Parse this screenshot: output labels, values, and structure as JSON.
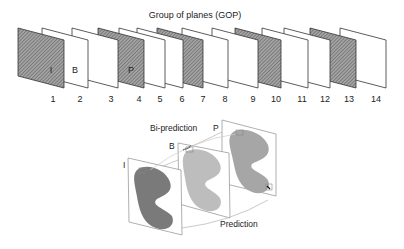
{
  "gop": {
    "title": "Group of planes (GOP)",
    "planes": [
      {
        "index": "1",
        "type": "I",
        "label": "I",
        "hatched": true,
        "x": 18
      },
      {
        "index": "2",
        "type": "B",
        "label": "B",
        "hatched": false,
        "x": 42
      },
      {
        "index": "3",
        "type": "B",
        "label": "",
        "hatched": false,
        "x": 72
      },
      {
        "index": "4",
        "type": "P",
        "label": "P",
        "hatched": true,
        "x": 98
      },
      {
        "index": "5",
        "type": "B",
        "label": "",
        "hatched": false,
        "x": 119
      },
      {
        "index": "6",
        "type": "B",
        "label": "",
        "hatched": false,
        "x": 137
      },
      {
        "index": "7",
        "type": "P",
        "label": "",
        "hatched": true,
        "x": 157
      },
      {
        "index": "8",
        "type": "B",
        "label": "",
        "hatched": false,
        "x": 182
      },
      {
        "index": "9",
        "type": "B",
        "label": "",
        "hatched": false,
        "x": 212
      },
      {
        "index": "10",
        "type": "P",
        "label": "",
        "hatched": true,
        "x": 235
      },
      {
        "index": "11",
        "type": "B",
        "label": "",
        "hatched": false,
        "x": 262
      },
      {
        "index": "12",
        "type": "B",
        "label": "",
        "hatched": false,
        "x": 284
      },
      {
        "index": "13",
        "type": "P",
        "label": "",
        "hatched": true,
        "x": 310
      },
      {
        "index": "14",
        "type": "B",
        "label": "",
        "hatched": false,
        "x": 340
      }
    ]
  },
  "prediction_diagram": {
    "bi_prediction_label": "Bi-prediction",
    "prediction_label": "Prediction",
    "frames": [
      {
        "label": "I",
        "shade": "#7a7a7a"
      },
      {
        "label": "B",
        "shade": "#bdbdbd"
      },
      {
        "label": "P",
        "shade": "#a6a6a6"
      }
    ]
  },
  "colors": {
    "stroke": "#333333",
    "hatch_bg": "#9a9a9a",
    "hatch_line": "#5a5a5a",
    "frame_outline": "#8a8a8a"
  }
}
